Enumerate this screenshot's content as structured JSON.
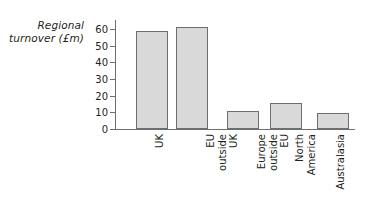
{
  "chart_data": {
    "type": "bar",
    "title": "",
    "subtitle": "",
    "xlabel": "",
    "ylabel": "Regional\nturnover (£m)",
    "ylabel_line1": "Regional",
    "ylabel_line2": "turnover (£m)",
    "categories": [
      "UK",
      "EU outside UK",
      "Europe outside EU",
      "North America",
      "Australasia"
    ],
    "category_lines": [
      [
        "UK"
      ],
      [
        "EU",
        "outside",
        "UK"
      ],
      [
        "Europe",
        "outside",
        "EU"
      ],
      [
        "North",
        "America"
      ],
      [
        "Australasia"
      ]
    ],
    "values": [
      59,
      61.5,
      11,
      16,
      10
    ],
    "ylim": [
      0,
      65
    ],
    "yticks": [
      0,
      10,
      20,
      30,
      40,
      50,
      60
    ],
    "ytick_labels": [
      "0",
      "10",
      "20",
      "30",
      "40",
      "50",
      "60"
    ],
    "grid": false,
    "legend": false,
    "legend_position": "none",
    "bar_fill_color": "#d8d9d8",
    "bar_edge_color": "#6d6e70",
    "axis_color": "#6d6e70",
    "text_color": "#231f20",
    "background_color": "#ffffff",
    "tick_direction": "out",
    "label_rotation": 90
  }
}
